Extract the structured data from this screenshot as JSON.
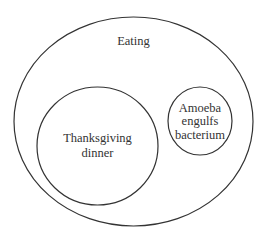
{
  "diagram": {
    "type": "venn-subset",
    "outer": {
      "label": "Eating"
    },
    "inner_left": {
      "lines": [
        "Thanksgiving",
        "dinner"
      ]
    },
    "inner_right": {
      "lines": [
        "Amoeba",
        "engulfs",
        "bacterium"
      ]
    },
    "stroke_color": "#333333",
    "background": "#ffffff"
  }
}
